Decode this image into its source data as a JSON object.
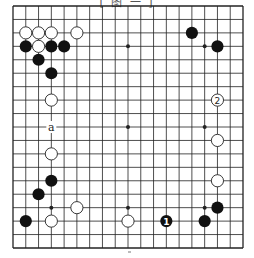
{
  "diagram": {
    "title": "[ 图 一 ]",
    "board_size": 19,
    "geometry": {
      "left": 13,
      "right": 243,
      "top": 6,
      "bottom": 248
    },
    "colors": {
      "line": "#222222",
      "black": "#111111",
      "white": "#ffffff",
      "background": "#ffffff"
    },
    "star_points_visible": [
      [
        9,
        3
      ],
      [
        15,
        3
      ],
      [
        9,
        9
      ],
      [
        15,
        9
      ],
      [
        3,
        15
      ],
      [
        9,
        15
      ],
      [
        15,
        15
      ]
    ],
    "black_stones": [
      {
        "col": 1,
        "row": 3
      },
      {
        "col": 3,
        "row": 3
      },
      {
        "col": 4,
        "row": 3
      },
      {
        "col": 2,
        "row": 4
      },
      {
        "col": 3,
        "row": 5
      },
      {
        "col": 14,
        "row": 2
      },
      {
        "col": 16,
        "row": 3
      },
      {
        "col": 3,
        "row": 13
      },
      {
        "col": 2,
        "row": 14
      },
      {
        "col": 1,
        "row": 16
      },
      {
        "col": 12,
        "row": 16,
        "label": "1"
      },
      {
        "col": 16,
        "row": 15
      },
      {
        "col": 15,
        "row": 16
      }
    ],
    "white_stones": [
      {
        "col": 1,
        "row": 2
      },
      {
        "col": 2,
        "row": 2
      },
      {
        "col": 3,
        "row": 2
      },
      {
        "col": 5,
        "row": 2
      },
      {
        "col": 2,
        "row": 3
      },
      {
        "col": 3,
        "row": 7
      },
      {
        "col": 3,
        "row": 11
      },
      {
        "col": 16,
        "row": 7,
        "label": "2"
      },
      {
        "col": 16,
        "row": 10
      },
      {
        "col": 16,
        "row": 13
      },
      {
        "col": 5,
        "row": 15
      },
      {
        "col": 3,
        "row": 16
      },
      {
        "col": 9,
        "row": 16
      }
    ],
    "point_labels": [
      {
        "col": 3,
        "row": 9,
        "text": "a"
      }
    ]
  }
}
